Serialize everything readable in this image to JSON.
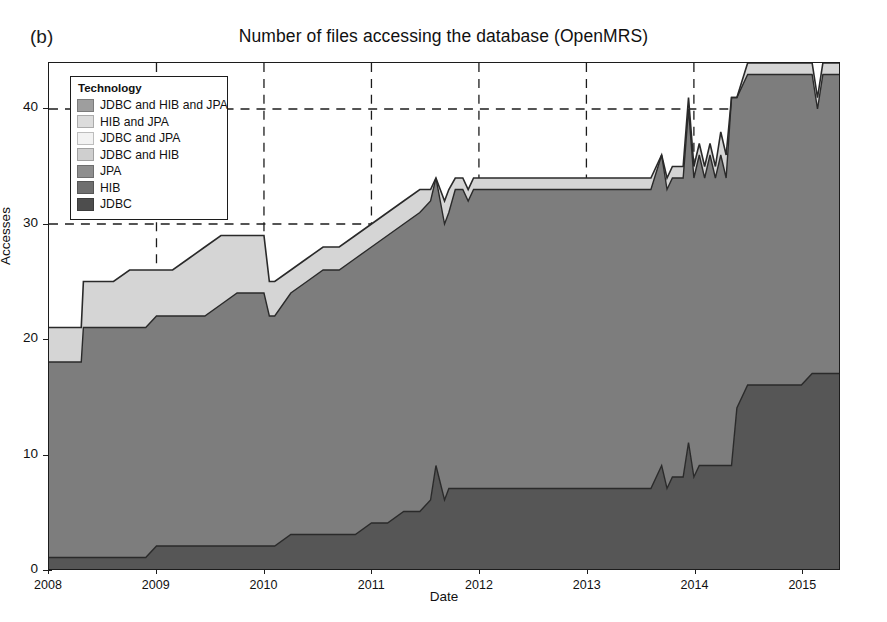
{
  "panel_label": "(b)",
  "chart_data": {
    "type": "area",
    "stacked": true,
    "title": "Number of files accessing the database (OpenMRS)",
    "xlabel": "Date",
    "ylabel": "Accesses",
    "xlim": [
      2008,
      2015.35
    ],
    "ylim": [
      0,
      44
    ],
    "yticks": [
      0,
      10,
      20,
      30,
      40
    ],
    "xticks": [
      2008,
      2009,
      2010,
      2011,
      2012,
      2013,
      2014,
      2015
    ],
    "grid": "dashed-both",
    "legend_title": "Technology",
    "legend_position": "upper-left-inside",
    "series": [
      {
        "name": "JDBC",
        "color": "#4a4a4a",
        "order": 1
      },
      {
        "name": "HIB",
        "color": "#7b7b7b",
        "order": 2
      },
      {
        "name": "JPA",
        "color": "#8e8e8e",
        "order": 3
      },
      {
        "name": "JDBC and HIB",
        "color": "#c9c9c9",
        "order": 4
      },
      {
        "name": "JDBC and JPA",
        "color": "#f0f0f0",
        "order": 5
      },
      {
        "name": "HIB and JPA",
        "color": "#dcdcdc",
        "order": 6
      },
      {
        "name": "JDBC and HIB and JPA",
        "color": "#9e9e9e",
        "order": 7
      }
    ],
    "x": [
      2008.0,
      2008.15,
      2008.3,
      2008.32,
      2008.45,
      2008.6,
      2008.75,
      2008.9,
      2009.0,
      2009.15,
      2009.3,
      2009.45,
      2009.6,
      2009.75,
      2009.9,
      2010.0,
      2010.05,
      2010.1,
      2010.25,
      2010.4,
      2010.55,
      2010.7,
      2010.85,
      2011.0,
      2011.15,
      2011.3,
      2011.45,
      2011.55,
      2011.6,
      2011.68,
      2011.72,
      2011.78,
      2011.85,
      2011.9,
      2011.95,
      2012.0,
      2012.2,
      2012.4,
      2012.6,
      2012.8,
      2013.0,
      2013.2,
      2013.4,
      2013.6,
      2013.7,
      2013.75,
      2013.8,
      2013.85,
      2013.9,
      2013.95,
      2014.0,
      2014.05,
      2014.1,
      2014.15,
      2014.2,
      2014.25,
      2014.3,
      2014.35,
      2014.4,
      2014.5,
      2014.6,
      2014.7,
      2014.8,
      2015.0,
      2015.1,
      2015.15,
      2015.2,
      2015.35
    ],
    "cumulative_jdbc": [
      1,
      1,
      1,
      1,
      1,
      1,
      1,
      1,
      2,
      2,
      2,
      2,
      2,
      2,
      2,
      2,
      2,
      2,
      3,
      3,
      3,
      3,
      3,
      4,
      4,
      5,
      5,
      6,
      9,
      6,
      7,
      7,
      7,
      7,
      7,
      7,
      7,
      7,
      7,
      7,
      7,
      7,
      7,
      7,
      9,
      7,
      8,
      8,
      8,
      11,
      8,
      9,
      9,
      9,
      9,
      9,
      9,
      9,
      14,
      16,
      16,
      16,
      16,
      16,
      17,
      17,
      17,
      17
    ],
    "cumulative_hib_top": [
      18,
      18,
      18,
      21,
      21,
      21,
      21,
      21,
      22,
      22,
      22,
      22,
      23,
      24,
      24,
      24,
      22,
      22,
      24,
      25,
      26,
      26,
      27,
      28,
      29,
      30,
      31,
      32,
      34,
      30,
      31,
      33,
      33,
      32,
      33,
      33,
      33,
      33,
      33,
      33,
      33,
      33,
      33,
      33,
      36,
      33,
      34,
      34,
      34,
      40,
      34,
      36,
      34,
      36,
      34,
      36,
      34,
      41,
      41,
      43,
      43,
      43,
      43,
      43,
      43,
      40,
      43,
      43
    ],
    "cumulative_total": [
      21,
      21,
      21,
      25,
      25,
      25,
      26,
      26,
      26,
      26,
      27,
      28,
      29,
      29,
      29,
      29,
      25,
      25,
      26,
      27,
      28,
      28,
      29,
      30,
      31,
      32,
      33,
      33,
      34,
      32,
      33,
      34,
      34,
      33,
      34,
      34,
      34,
      34,
      34,
      34,
      34,
      34,
      34,
      34,
      36,
      34,
      35,
      35,
      35,
      41,
      35,
      37,
      35,
      37,
      35,
      38,
      36,
      41,
      41,
      44,
      44,
      44,
      44,
      44,
      44,
      41,
      44,
      44
    ]
  },
  "legend": {
    "title": "Technology",
    "items": [
      {
        "label": "JDBC and HIB and JPA",
        "color": "#9e9e9e"
      },
      {
        "label": "HIB and JPA",
        "color": "#dcdcdc"
      },
      {
        "label": "JDBC and JPA",
        "color": "#f2f2f2"
      },
      {
        "label": "JDBC and HIB",
        "color": "#cfcfcf"
      },
      {
        "label": "JPA",
        "color": "#8e8e8e"
      },
      {
        "label": "HIB",
        "color": "#6f6f6f"
      },
      {
        "label": "JDBC",
        "color": "#4d4d4d"
      }
    ]
  },
  "axes": {
    "y_ticks": [
      "0",
      "10",
      "20",
      "30",
      "40"
    ],
    "x_ticks": [
      "2008",
      "2009",
      "2010",
      "2011",
      "2012",
      "2013",
      "2014",
      "2015"
    ]
  }
}
